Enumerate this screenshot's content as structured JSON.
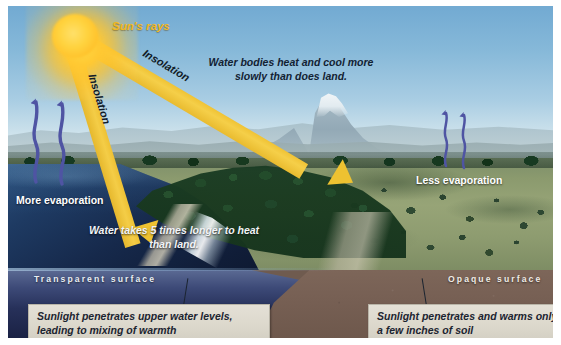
{
  "figure": {
    "sun": {
      "label": "Sun's rays",
      "icon": "sun-icon",
      "color": "#f2b81f"
    },
    "rays": [
      {
        "id": "ray-right",
        "label": "Insolation",
        "target": "land"
      },
      {
        "id": "ray-left",
        "label": "Insolation",
        "target": "water"
      }
    ],
    "annotations": {
      "water_bodies_note": "Water bodies heat and cool more slowly than does land.",
      "water_heat_note": "Water takes 5 times longer to heat than land."
    },
    "evaporation": {
      "more_label": "More evaporation",
      "less_label": "Less evaporation",
      "arrow_color": "#5a5fa8"
    },
    "surfaces": {
      "transparent_label": "Transparent surface",
      "opaque_label": "Opaque surface"
    },
    "captions": {
      "water_caption": "Sunlight penetrates upper water levels, leading to mixing of warmth",
      "soil_caption": "Sunlight penetrates and warms only a few inches of soil"
    },
    "colors": {
      "sky_top": "#72aad2",
      "sky_horizon": "#dce9ee",
      "beam": "#f0c335",
      "lake_deep": "#0b1529",
      "cross_section_water_top": "#5b6a93",
      "cross_section_soil": "#7d6659",
      "caption_box": "#dcd8cc",
      "grassland": "#97a477",
      "forest": "#19391f"
    }
  }
}
